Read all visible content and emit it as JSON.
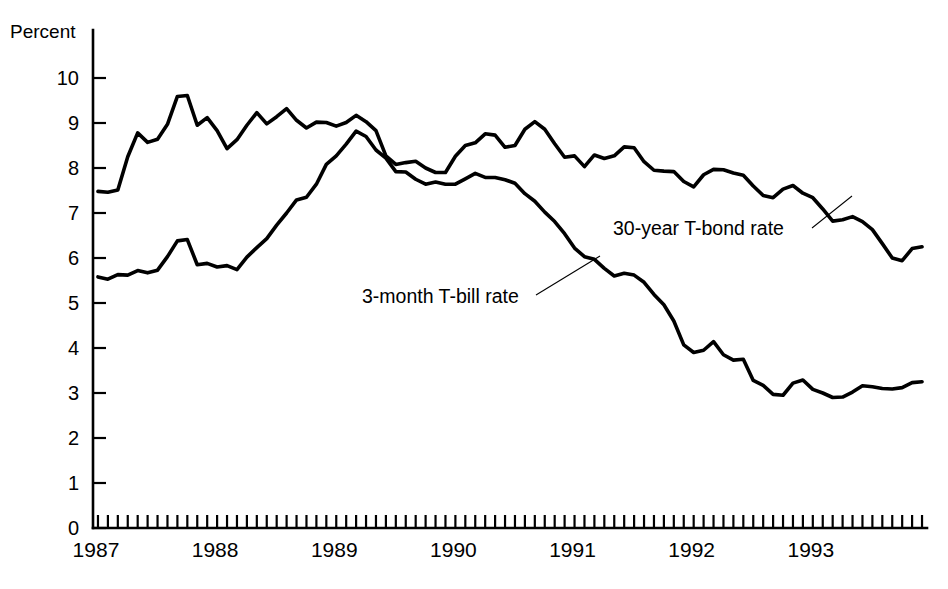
{
  "chart_data": {
    "type": "line",
    "title": "",
    "subtitle": "",
    "xlabel": "",
    "ylabel": "Percent",
    "ylim": [
      0,
      10
    ],
    "xlim": [
      "1987-01",
      "1993-12"
    ],
    "grid": false,
    "legend_position": "inline-annotations",
    "y_ticks": [
      "0",
      "1",
      "2",
      "3",
      "4",
      "5",
      "6",
      "7",
      "8",
      "9",
      "10"
    ],
    "x_tick_labels": [
      "1987",
      "1988",
      "1989",
      "1990",
      "1991",
      "1992",
      "1993"
    ],
    "x_tick_interval": "monthly",
    "x": [
      "1987-01",
      "1987-02",
      "1987-03",
      "1987-04",
      "1987-05",
      "1987-06",
      "1987-07",
      "1987-08",
      "1987-09",
      "1987-10",
      "1987-11",
      "1987-12",
      "1988-01",
      "1988-02",
      "1988-03",
      "1988-04",
      "1988-05",
      "1988-06",
      "1988-07",
      "1988-08",
      "1988-09",
      "1988-10",
      "1988-11",
      "1988-12",
      "1989-01",
      "1989-02",
      "1989-03",
      "1989-04",
      "1989-05",
      "1989-06",
      "1989-07",
      "1989-08",
      "1989-09",
      "1989-10",
      "1989-11",
      "1989-12",
      "1990-01",
      "1990-02",
      "1990-03",
      "1990-04",
      "1990-05",
      "1990-06",
      "1990-07",
      "1990-08",
      "1990-09",
      "1990-10",
      "1990-11",
      "1990-12",
      "1991-01",
      "1991-02",
      "1991-03",
      "1991-04",
      "1991-05",
      "1991-06",
      "1991-07",
      "1991-08",
      "1991-09",
      "1991-10",
      "1991-11",
      "1991-12",
      "1992-01",
      "1992-02",
      "1992-03",
      "1992-04",
      "1992-05",
      "1992-06",
      "1992-07",
      "1992-08",
      "1992-09",
      "1992-10",
      "1992-11",
      "1992-12",
      "1993-01",
      "1993-02",
      "1993-03",
      "1993-04",
      "1993-05",
      "1993-06",
      "1993-07",
      "1993-08",
      "1993-09",
      "1993-10",
      "1993-11",
      "1993-12"
    ],
    "series": [
      {
        "name": "30-year T-bond rate",
        "values": [
          7.48,
          7.46,
          7.51,
          8.25,
          8.78,
          8.57,
          8.64,
          8.97,
          9.59,
          9.61,
          8.95,
          9.12,
          8.83,
          8.43,
          8.63,
          8.95,
          9.23,
          8.98,
          9.14,
          9.32,
          9.06,
          8.89,
          9.02,
          9.01,
          8.93,
          9.01,
          9.17,
          9.03,
          8.83,
          8.27,
          8.08,
          8.12,
          8.15,
          8.0,
          7.9,
          7.9,
          8.26,
          8.5,
          8.56,
          8.76,
          8.73,
          8.46,
          8.5,
          8.86,
          9.03,
          8.86,
          8.54,
          8.24,
          8.27,
          8.03,
          8.29,
          8.21,
          8.27,
          8.47,
          8.45,
          8.14,
          7.95,
          7.93,
          7.92,
          7.7,
          7.58,
          7.85,
          7.97,
          7.96,
          7.89,
          7.84,
          7.6,
          7.39,
          7.34,
          7.53,
          7.61,
          7.44,
          7.34,
          7.09,
          6.82,
          6.85,
          6.92,
          6.81,
          6.63,
          6.32,
          6.0,
          5.94,
          6.21,
          6.25
        ]
      },
      {
        "name": "3-month T-bill rate",
        "values": [
          5.58,
          5.53,
          5.63,
          5.62,
          5.72,
          5.67,
          5.73,
          6.03,
          6.38,
          6.41,
          5.85,
          5.88,
          5.8,
          5.83,
          5.74,
          6.02,
          6.23,
          6.43,
          6.73,
          7.0,
          7.29,
          7.35,
          7.64,
          8.08,
          8.27,
          8.53,
          8.82,
          8.7,
          8.4,
          8.22,
          7.92,
          7.91,
          7.75,
          7.64,
          7.69,
          7.64,
          7.64,
          7.76,
          7.88,
          7.79,
          7.79,
          7.74,
          7.66,
          7.43,
          7.26,
          7.02,
          6.81,
          6.54,
          6.22,
          6.03,
          5.97,
          5.77,
          5.6,
          5.66,
          5.62,
          5.46,
          5.19,
          4.96,
          4.6,
          4.07,
          3.9,
          3.95,
          4.14,
          3.85,
          3.73,
          3.75,
          3.28,
          3.17,
          2.97,
          2.95,
          3.22,
          3.29,
          3.08,
          3.0,
          2.9,
          2.91,
          3.02,
          3.16,
          3.14,
          3.1,
          3.09,
          3.12,
          3.23,
          3.25
        ]
      }
    ],
    "annotations": [
      {
        "text": "30-year T-bond rate",
        "attached_to": "30-year T-bond rate"
      },
      {
        "text": "3-month T-bill rate",
        "attached_to": "3-month T-bill rate"
      }
    ]
  }
}
